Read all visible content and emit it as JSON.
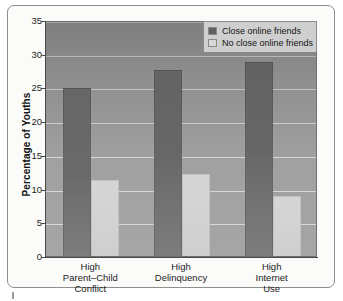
{
  "chart_data": {
    "type": "bar",
    "title": "",
    "subtitle": "",
    "xlabel": "",
    "ylabel": "Percentage of Youths",
    "ylim": [
      0,
      35
    ],
    "yticks": [
      0,
      5,
      10,
      15,
      20,
      25,
      30,
      35
    ],
    "ytick_labels": [
      "0",
      "5",
      "10",
      "15",
      "20",
      "25",
      "30",
      "35"
    ],
    "grid": true,
    "legend_position": "top-right",
    "categories": [
      "High\nParent–Child\nConflict",
      "High\nDelinquency",
      "High\nInternet\nUse"
    ],
    "category_lines": [
      [
        "High",
        "Parent–Child",
        "Conflict"
      ],
      [
        "High",
        "Delinquency"
      ],
      [
        "High",
        "Internet",
        "Use"
      ]
    ],
    "series": [
      {
        "name": "Close online friends",
        "color": "#5f5f5f",
        "values": [
          24.9,
          27.6,
          28.7
        ]
      },
      {
        "name": "No close online friends",
        "color": "#d2d2d2",
        "values": [
          11.3,
          12.1,
          8.9
        ]
      }
    ]
  },
  "axis": {
    "y_title": "Percentage of Youths"
  },
  "legend": {
    "items": [
      {
        "label": "Close online friends",
        "swatch": "dark"
      },
      {
        "label": "No close online friends",
        "swatch": "light"
      }
    ]
  }
}
